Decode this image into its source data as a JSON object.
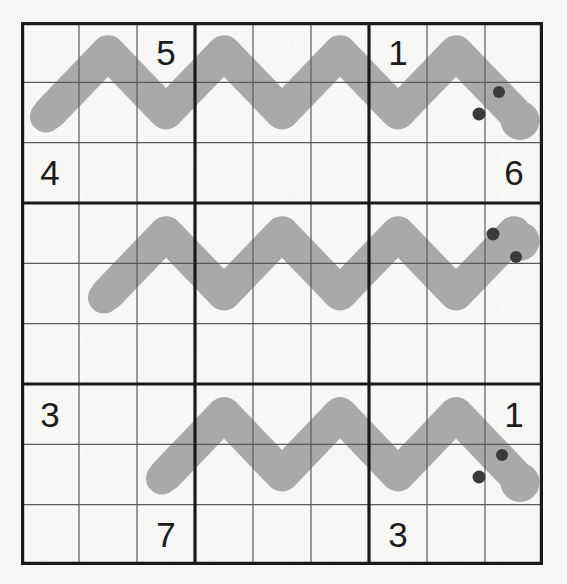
{
  "puzzle": {
    "title": "Snake Sudoku Grid",
    "grid": {
      "rows": 9,
      "columns": 9,
      "box_rows": 3,
      "box_columns": 3,
      "cell_width": 58,
      "cell_height": 60.33,
      "origin_x": 21,
      "origin_y": 22,
      "thin_line_color": "#5a5a5a",
      "thick_line_color": "#1a1a1a",
      "thin_line_width": 1.2,
      "thick_line_width": 3.2,
      "background_color": "#f7f7f5"
    },
    "clues": [
      {
        "row": 1,
        "col": 3,
        "value": "5"
      },
      {
        "row": 1,
        "col": 7,
        "value": "1"
      },
      {
        "row": 3,
        "col": 1,
        "value": "4"
      },
      {
        "row": 3,
        "col": 9,
        "value": "6"
      },
      {
        "row": 7,
        "col": 1,
        "value": "3"
      },
      {
        "row": 7,
        "col": 9,
        "value": "1"
      },
      {
        "row": 9,
        "col": 3,
        "value": "7"
      },
      {
        "row": 9,
        "col": 7,
        "value": "3"
      }
    ],
    "snakes": [
      {
        "name": "snake-top",
        "color": "#a9a9a9",
        "thickness": 34,
        "tail_cell": {
          "row": 2,
          "col": 1
        },
        "head_cell": {
          "row": 2,
          "col": 9
        },
        "path_cells": [
          {
            "row": 2,
            "col": 1
          },
          {
            "row": 1,
            "col": 2
          },
          {
            "row": 2,
            "col": 3
          },
          {
            "row": 1,
            "col": 4
          },
          {
            "row": 2,
            "col": 5
          },
          {
            "row": 1,
            "col": 6
          },
          {
            "row": 2,
            "col": 7
          },
          {
            "row": 1,
            "col": 8
          },
          {
            "row": 2,
            "col": 9
          }
        ],
        "eyes": [
          {
            "x": 499,
            "y": 92,
            "r": 6
          },
          {
            "x": 479,
            "y": 114,
            "r": 6.5
          }
        ]
      },
      {
        "name": "snake-middle",
        "color": "#a9a9a9",
        "thickness": 34,
        "tail_cell": {
          "row": 5,
          "col": 2
        },
        "head_cell": {
          "row": 4,
          "col": 9
        },
        "path_cells": [
          {
            "row": 5,
            "col": 2
          },
          {
            "row": 4,
            "col": 3
          },
          {
            "row": 5,
            "col": 4
          },
          {
            "row": 4,
            "col": 5
          },
          {
            "row": 5,
            "col": 6
          },
          {
            "row": 4,
            "col": 7
          },
          {
            "row": 5,
            "col": 8
          },
          {
            "row": 4,
            "col": 9
          }
        ],
        "eyes": [
          {
            "x": 493,
            "y": 234,
            "r": 6.5
          },
          {
            "x": 516,
            "y": 257,
            "r": 6
          }
        ]
      },
      {
        "name": "snake-bottom",
        "color": "#a9a9a9",
        "thickness": 34,
        "tail_cell": {
          "row": 8,
          "col": 3
        },
        "head_cell": {
          "row": 8,
          "col": 9
        },
        "path_cells": [
          {
            "row": 8,
            "col": 3
          },
          {
            "row": 7,
            "col": 4
          },
          {
            "row": 8,
            "col": 5
          },
          {
            "row": 7,
            "col": 6
          },
          {
            "row": 8,
            "col": 7
          },
          {
            "row": 7,
            "col": 8
          },
          {
            "row": 8,
            "col": 9
          }
        ],
        "eyes": [
          {
            "x": 502,
            "y": 455,
            "r": 6
          },
          {
            "x": 479,
            "y": 477,
            "r": 6.5
          }
        ]
      }
    ],
    "eye_color": "#3a3a3a"
  }
}
